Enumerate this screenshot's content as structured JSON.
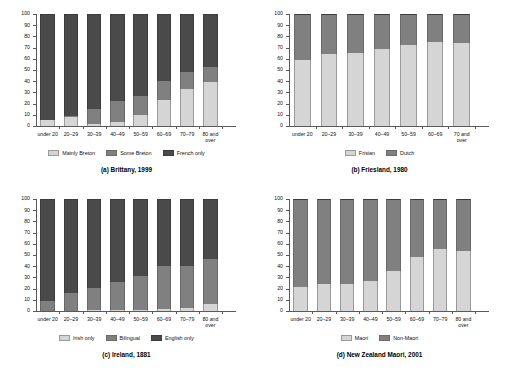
{
  "figure": {
    "panel_count": 4,
    "y_axis": {
      "ticks": [
        0,
        10,
        20,
        30,
        40,
        50,
        60,
        70,
        80,
        90,
        100
      ],
      "min": 0,
      "max": 100
    }
  },
  "chart_data": [
    {
      "id": "a",
      "type": "bar",
      "stacked": true,
      "title": "(a) Brittany, 1999",
      "xlabel": "",
      "ylabel": "",
      "ylim": [
        0,
        100
      ],
      "grid": false,
      "legend_position": "bottom",
      "categories": [
        "under 20",
        "20–29",
        "30–39",
        "40–49",
        "50–59",
        "60–69",
        "70–79",
        "80 and over"
      ],
      "series": [
        {
          "name": "Mainly Breton",
          "color": "#d5d5d5",
          "values": [
            5,
            8,
            2,
            4,
            10,
            23,
            33,
            39
          ]
        },
        {
          "name": "Some Breton",
          "color": "#808080",
          "values": [
            0,
            1,
            13,
            18,
            17,
            17,
            15,
            14
          ]
        },
        {
          "name": "French only",
          "color": "#4a4a4a",
          "values": [
            95,
            91,
            85,
            78,
            73,
            60,
            52,
            47
          ]
        }
      ]
    },
    {
      "id": "b",
      "type": "bar",
      "stacked": true,
      "title": "(b) Friesland, 1980",
      "xlabel": "",
      "ylabel": "",
      "ylim": [
        0,
        100
      ],
      "grid": false,
      "legend_position": "bottom",
      "categories": [
        "under 20",
        "20–29",
        "30–39",
        "40–49",
        "50–59",
        "60–69",
        "70 and over"
      ],
      "series": [
        {
          "name": "Frisian",
          "color": "#d5d5d5",
          "values": [
            59,
            64,
            65,
            69,
            72,
            75,
            74
          ]
        },
        {
          "name": "Dutch",
          "color": "#808080",
          "values": [
            41,
            36,
            35,
            31,
            28,
            25,
            26
          ]
        }
      ]
    },
    {
      "id": "c",
      "type": "bar",
      "stacked": true,
      "title": "(c) Ireland, 1881",
      "xlabel": "",
      "ylabel": "",
      "ylim": [
        0,
        100
      ],
      "grid": false,
      "legend_position": "bottom",
      "categories": [
        "under 20",
        "20–29",
        "30–39",
        "40–49",
        "50–59",
        "60–69",
        "70–79",
        "80 and over"
      ],
      "series": [
        {
          "name": "Irish only",
          "color": "#d5d5d5",
          "values": [
            0,
            0,
            1,
            1,
            1,
            2,
            3,
            6
          ]
        },
        {
          "name": "Bilingual",
          "color": "#808080",
          "values": [
            9,
            16,
            20,
            25,
            30,
            38,
            37,
            40
          ]
        },
        {
          "name": "English only",
          "color": "#4a4a4a",
          "values": [
            91,
            84,
            79,
            74,
            69,
            60,
            60,
            54
          ]
        }
      ]
    },
    {
      "id": "d",
      "type": "bar",
      "stacked": true,
      "title": "(d) New Zealand Maori, 2001",
      "xlabel": "",
      "ylabel": "",
      "ylim": [
        0,
        100
      ],
      "grid": false,
      "legend_position": "bottom",
      "categories": [
        "under 20",
        "20–29",
        "30–39",
        "40–49",
        "50–59",
        "60–69",
        "70–79",
        "80 and over"
      ],
      "series": [
        {
          "name": "Maori",
          "color": "#d5d5d5",
          "values": [
            21,
            24,
            24,
            27,
            36,
            48,
            55,
            54
          ]
        },
        {
          "name": "Non-Maori",
          "color": "#808080",
          "values": [
            79,
            76,
            76,
            73,
            64,
            52,
            45,
            46
          ]
        }
      ]
    }
  ]
}
